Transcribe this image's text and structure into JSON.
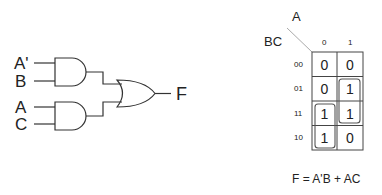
{
  "circuit": {
    "inputs": [
      "A'",
      "B",
      "A",
      "C"
    ],
    "output": "F",
    "gates": [
      {
        "type": "AND",
        "inputs": [
          "A'",
          "B"
        ]
      },
      {
        "type": "AND",
        "inputs": [
          "A",
          "C"
        ]
      },
      {
        "type": "OR",
        "inputs": [
          "AND1",
          "AND2"
        ],
        "output": "F"
      }
    ]
  },
  "kmap": {
    "col_var": "A",
    "row_var": "BC",
    "col_headers": [
      "0",
      "1"
    ],
    "row_headers": [
      "00",
      "01",
      "11",
      "10"
    ],
    "cells": [
      [
        "0",
        "0"
      ],
      [
        "0",
        "1"
      ],
      [
        "1",
        "1"
      ],
      [
        "1",
        "0"
      ]
    ],
    "groups": [
      "A'B (col 0, rows 11-10)",
      "AC (col 1, rows 01-11)"
    ]
  },
  "equation": "F = A'B + AC"
}
